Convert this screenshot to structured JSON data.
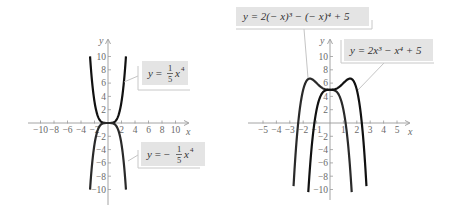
{
  "figure": {
    "panels": [
      {
        "id": "left",
        "y_axis_label": "y",
        "x_axis_label": "x",
        "x_tick_labels": [
          "−10",
          "−8",
          "−6",
          "−4",
          "−2",
          "2",
          "4",
          "6",
          "8",
          "10"
        ],
        "y_tick_labels": [
          "10",
          "8",
          "6",
          "4",
          "2",
          "−2",
          "−4",
          "−6",
          "−8",
          "−10"
        ],
        "labels": [
          {
            "prefix": "y = ",
            "coef_num": "1",
            "coef_den": "5",
            "var": "x",
            "exp": "4"
          },
          {
            "prefix": "y = −",
            "coef_num": "1",
            "coef_den": "5",
            "var": "x",
            "exp": "4"
          }
        ]
      },
      {
        "id": "right",
        "y_axis_label": "y",
        "x_axis_label": "x",
        "x_tick_labels": [
          "−5",
          "−4",
          "−3",
          "−2",
          "−1",
          "1",
          "2",
          "3",
          "4",
          "5"
        ],
        "y_tick_labels": [
          "10",
          "8",
          "6",
          "4",
          "2",
          "−2",
          "−4",
          "−6",
          "−8",
          "−10"
        ],
        "labels": [
          {
            "text": "y = 2(− x)³ − (− x)⁴ + 5"
          },
          {
            "text": "y = 2x³ − x⁴ + 5"
          }
        ]
      }
    ]
  },
  "chart_data": [
    {
      "type": "line",
      "title": "",
      "xlabel": "x",
      "ylabel": "y",
      "xlim": [
        -10,
        10
      ],
      "ylim": [
        -10,
        10
      ],
      "x_ticks": [
        -10,
        -8,
        -6,
        -4,
        -2,
        2,
        4,
        6,
        8,
        10
      ],
      "y_ticks": [
        -10,
        -8,
        -6,
        -4,
        -2,
        2,
        4,
        6,
        8,
        10
      ],
      "grid": false,
      "series": [
        {
          "name": "y = (1/5)x^4",
          "x": [
            -2.66,
            -2,
            -1,
            0,
            1,
            2,
            2.66
          ],
          "y": [
            10,
            3.2,
            0.2,
            0,
            0.2,
            3.2,
            10
          ]
        },
        {
          "name": "y = -(1/5)x^4",
          "x": [
            -2.66,
            -2,
            -1,
            0,
            1,
            2,
            2.66
          ],
          "y": [
            -10,
            -3.2,
            -0.2,
            0,
            -0.2,
            -3.2,
            -10
          ]
        }
      ]
    },
    {
      "type": "line",
      "title": "",
      "xlabel": "x",
      "ylabel": "y",
      "xlim": [
        -5,
        5
      ],
      "ylim": [
        -10,
        10
      ],
      "x_ticks": [
        -5,
        -4,
        -3,
        -2,
        -1,
        1,
        2,
        3,
        4,
        5
      ],
      "y_ticks": [
        -10,
        -8,
        -6,
        -4,
        -2,
        2,
        4,
        6,
        8,
        10
      ],
      "grid": false,
      "series": [
        {
          "name": "y = 2(-x)^3 - (-x)^4 + 5",
          "x": [
            -2.7,
            -2.37,
            -2,
            -1.5,
            -1,
            0,
            1,
            1.16,
            1.6
          ],
          "y": [
            -10.5,
            0,
            5,
            6.69,
            6,
            5,
            2,
            0,
            -10.5
          ]
        },
        {
          "name": "y = 2x^3 - x^4 + 5",
          "x": [
            -1.6,
            -1.16,
            -1,
            0,
            1,
            1.5,
            2,
            2.37,
            2.7
          ],
          "y": [
            -10.5,
            0,
            2,
            5,
            6,
            6.69,
            5,
            0,
            -10.5
          ]
        }
      ]
    }
  ]
}
